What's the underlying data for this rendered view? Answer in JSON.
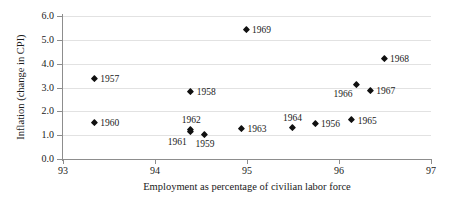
{
  "chart_data": {
    "type": "scatter",
    "title": "",
    "xlabel": "Employment as percentage of civilian labor force",
    "ylabel": "Inflation (change in CPI)",
    "xlim": [
      93,
      97
    ],
    "ylim": [
      0.0,
      6.0
    ],
    "xticks": [
      "93",
      "94",
      "95",
      "96",
      "97"
    ],
    "yticks": [
      "0.0",
      "1.0",
      "2.0",
      "3.0",
      "4.0",
      "5.0",
      "6.0"
    ],
    "grid": "horizontal",
    "legend": "none",
    "marker_style": "diamond",
    "marker_color": "#111111",
    "grid_color": "#e2e2e2",
    "axis_color": "#8d8d8d",
    "points": [
      {
        "label": "1957",
        "x": 93.35,
        "y": 3.35,
        "label_pos": "right"
      },
      {
        "label": "1960",
        "x": 93.35,
        "y": 1.5,
        "label_pos": "right"
      },
      {
        "label": "1958",
        "x": 94.4,
        "y": 2.8,
        "label_pos": "right"
      },
      {
        "label": "1962",
        "x": 94.4,
        "y": 1.2,
        "label_pos": "above"
      },
      {
        "label": "1961",
        "x": 94.4,
        "y": 1.1,
        "label_pos": "below-left"
      },
      {
        "label": "1959",
        "x": 94.55,
        "y": 1.0,
        "label_pos": "below"
      },
      {
        "label": "1969",
        "x": 95.0,
        "y": 5.4,
        "label_pos": "right"
      },
      {
        "label": "1963",
        "x": 94.95,
        "y": 1.25,
        "label_pos": "right"
      },
      {
        "label": "1964",
        "x": 95.5,
        "y": 1.3,
        "label_pos": "above"
      },
      {
        "label": "1956",
        "x": 95.75,
        "y": 1.45,
        "label_pos": "right"
      },
      {
        "label": "1965",
        "x": 96.15,
        "y": 1.6,
        "label_pos": "right"
      },
      {
        "label": "1966",
        "x": 96.2,
        "y": 3.1,
        "label_pos": "below-left"
      },
      {
        "label": "1967",
        "x": 96.35,
        "y": 2.85,
        "label_pos": "right"
      },
      {
        "label": "1968",
        "x": 96.5,
        "y": 4.2,
        "label_pos": "right"
      }
    ]
  }
}
